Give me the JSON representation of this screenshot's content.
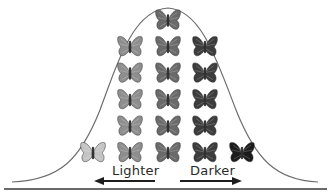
{
  "diagram": {
    "title": "",
    "type": "normal distribution of butterfly coloration",
    "labels": {
      "left": "Lighter",
      "right": "Darker"
    },
    "arrows": [
      {
        "direction": "left",
        "label": "Lighter"
      },
      {
        "direction": "right",
        "label": "Darker"
      }
    ],
    "colors": {
      "curve": "#6e6e6e",
      "arrow": "#1e1e1e",
      "baseline": "#6a6a6a"
    },
    "columns": [
      {
        "shade": "lightest",
        "color": "#c4c4c4",
        "count": 1
      },
      {
        "shade": "light",
        "color": "#8e8e8e",
        "count": 5
      },
      {
        "shade": "medium",
        "color": "#6a6a6a",
        "count": 6
      },
      {
        "shade": "dark",
        "color": "#3c3c3c",
        "count": 5
      },
      {
        "shade": "darkest",
        "color": "#1c1c1c",
        "count": 1
      }
    ]
  }
}
